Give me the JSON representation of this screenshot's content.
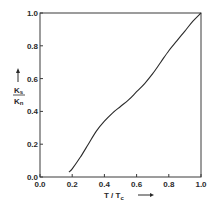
{
  "chart_data": {
    "type": "line",
    "title": "",
    "xlabel": "T / Tc",
    "ylabel": "Ks / Kn",
    "xlim": [
      0.0,
      1.0
    ],
    "ylim": [
      0.0,
      1.0
    ],
    "grid": false,
    "legend": null,
    "x_ticks": [
      "0.0",
      "0.2",
      "0.4",
      "0.6",
      "0.8",
      "1.0"
    ],
    "y_ticks": [
      "0.0",
      "0.2",
      "0.4",
      "0.6",
      "0.8",
      "1.0"
    ],
    "series": [
      {
        "name": "Ks/Kn",
        "x": [
          0.18,
          0.2,
          0.25,
          0.3,
          0.35,
          0.4,
          0.45,
          0.5,
          0.55,
          0.6,
          0.65,
          0.7,
          0.75,
          0.8,
          0.85,
          0.9,
          0.95,
          1.0
        ],
        "y": [
          0.03,
          0.05,
          0.12,
          0.2,
          0.28,
          0.34,
          0.39,
          0.43,
          0.47,
          0.52,
          0.57,
          0.63,
          0.7,
          0.77,
          0.83,
          0.89,
          0.95,
          1.0
        ]
      }
    ]
  },
  "axes": {
    "x": {
      "label_main": "T / T",
      "label_sub": "c",
      "arrow": "→"
    },
    "y": {
      "numerator_main": "K",
      "numerator_sub": "s",
      "denominator_main": "K",
      "denominator_sub": "n",
      "arrow": "↑"
    }
  },
  "colors": {
    "line": "#2a2a2a",
    "frame": "#3a3a3a",
    "background": "#ffffff"
  }
}
